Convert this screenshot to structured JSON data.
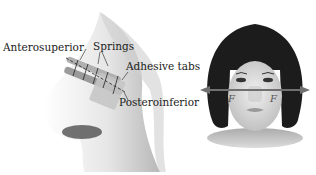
{
  "left_figure": {
    "name": "nose-profile-with-spring-device",
    "labels": {
      "anterosuperior": "Anterosuperior",
      "springs": "Springs",
      "adhesive_tabs": "Adhesive tabs",
      "posteroinferior": "Posteroinferior"
    }
  },
  "right_figure": {
    "name": "frontal-face-with-force-arrows",
    "force_labels": {
      "left": "F",
      "right": "F"
    }
  },
  "colors": {
    "skin_shade": "#c8c8c8",
    "hair": "#1a1a1a",
    "device": "#a0a0a0",
    "arrow": "#808080"
  }
}
